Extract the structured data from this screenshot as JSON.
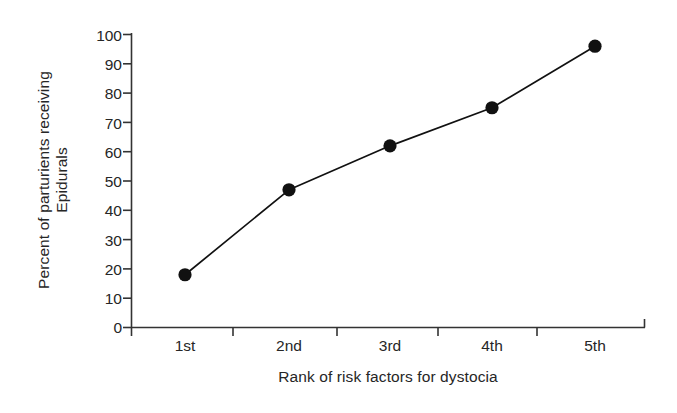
{
  "chart_data": {
    "type": "line",
    "title": "",
    "xlabel": "Rank of risk factors for dystocia",
    "ylabel": "Percent of parturients receiving Epidurals",
    "ylabel_lines": [
      "Percent of parturients receiving",
      "Epidurals"
    ],
    "categories": [
      "1st",
      "2nd",
      "3rd",
      "4th",
      "5th"
    ],
    "values": [
      18,
      47,
      62,
      75,
      96
    ],
    "series": [
      {
        "name": "Percent of parturients receiving Epidurals",
        "values": [
          18,
          47,
          62,
          75,
          96
        ]
      }
    ],
    "ylim": [
      0,
      100
    ],
    "yticks": [
      0,
      10,
      20,
      30,
      40,
      50,
      60,
      70,
      80,
      90,
      100
    ],
    "ytick_labels": [
      "0",
      "10",
      "20",
      "30",
      "40",
      "50",
      "60",
      "70",
      "80",
      "90",
      "100"
    ],
    "xtick_labels": [
      "1st",
      "2nd",
      "3rd",
      "4th",
      "5th"
    ],
    "grid": false,
    "legend": false,
    "legend_position": "none",
    "marker": "filled-circle",
    "line_color": "#111111",
    "marker_color": "#111111",
    "background_color": "#ffffff",
    "axis_color": "#333333"
  }
}
